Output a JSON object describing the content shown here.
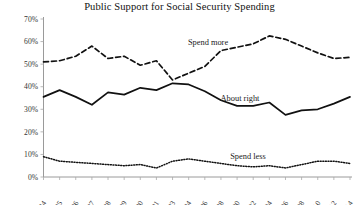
{
  "chart_data": {
    "type": "line",
    "title": "Public Support for Social Security Spending",
    "xlabel": "",
    "ylabel": "",
    "ylim": [
      0,
      70
    ],
    "ytick_labels": [
      "0%",
      "10%",
      "20%",
      "30%",
      "40%",
      "50%",
      "60%",
      "70%"
    ],
    "ytick_values": [
      0,
      10,
      20,
      30,
      40,
      50,
      60,
      70
    ],
    "grid": false,
    "legend_position": "inline-annotations",
    "categories": [
      "1984",
      "1985",
      "1986",
      "1987",
      "1988",
      "1989",
      "1990",
      "1991",
      "1993",
      "1994",
      "1996",
      "1998",
      "2000",
      "2002",
      "2004",
      "2006",
      "2008",
      "2010",
      "2012",
      "2014"
    ],
    "series": [
      {
        "name": "Spend more",
        "style": "dashed",
        "color": "#111111",
        "values": [
          51,
          51.5,
          53.5,
          58,
          52.5,
          53.5,
          49.5,
          51.5,
          43,
          46,
          49,
          56,
          57.5,
          59,
          62.5,
          61,
          58,
          55,
          52.5,
          53
        ]
      },
      {
        "name": "About right",
        "style": "solid",
        "color": "#111111",
        "values": [
          35.5,
          38.5,
          35.5,
          32,
          37.5,
          36.5,
          39.5,
          38.5,
          41.5,
          41,
          38,
          34,
          31.5,
          31.5,
          33,
          27.5,
          29.5,
          30,
          32.5,
          35.5
        ]
      },
      {
        "name": "Spend less",
        "style": "dotted",
        "color": "#111111",
        "values": [
          9,
          7,
          6.5,
          6,
          5.5,
          5,
          5.5,
          4,
          7,
          8,
          7,
          6,
          5,
          4.5,
          5,
          4,
          5.5,
          7,
          7,
          6
        ]
      }
    ],
    "annotations": [
      {
        "text": "Spend more",
        "series": "Spend more"
      },
      {
        "text": "About right",
        "series": "About right"
      },
      {
        "text": "Spend less",
        "series": "Spend less"
      }
    ]
  }
}
